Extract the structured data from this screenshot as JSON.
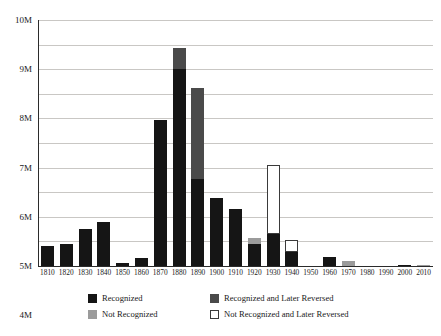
{
  "chart_data": {
    "type": "bar",
    "title": "",
    "subtitle": "",
    "xlabel": "",
    "ylabel": "",
    "stacked": true,
    "grid": true,
    "legend_position": "bottom",
    "ylim": [
      0,
      10000000
    ],
    "ytick_labels": [
      "0",
      "1M",
      "2M",
      "3M",
      "4M",
      "5M",
      "6M",
      "7M",
      "8M",
      "9M",
      "10M"
    ],
    "ytick_values": [
      0,
      1000000,
      2000000,
      3000000,
      4000000,
      5000000,
      6000000,
      7000000,
      8000000,
      9000000,
      10000000
    ],
    "categories": [
      "1810",
      "1820",
      "1830",
      "1840",
      "1850",
      "1860",
      "1870",
      "1880",
      "1890",
      "1900",
      "1910",
      "1920",
      "1930",
      "1940",
      "1950",
      "1960",
      "1970",
      "1980",
      "1990",
      "2000",
      "2010"
    ],
    "series": [
      {
        "name": "Recognized",
        "color": "#151515",
        "values": [
          800000,
          880000,
          1520000,
          1800000,
          130000,
          330000,
          5950000,
          8000000,
          3520000,
          2750000,
          2300000,
          900000,
          1320000,
          560000,
          0,
          350000,
          0,
          0,
          0,
          60000,
          0
        ]
      },
      {
        "name": "Recognized and Later Reversed",
        "color": "#4a4a4a",
        "values": [
          0,
          0,
          0,
          0,
          0,
          0,
          0,
          850000,
          3730000,
          0,
          0,
          0,
          0,
          0,
          0,
          0,
          0,
          0,
          0,
          0,
          0
        ]
      },
      {
        "name": "Not Recognized",
        "color": "#9b9b9b",
        "values": [
          0,
          0,
          0,
          0,
          0,
          0,
          0,
          0,
          0,
          0,
          0,
          250000,
          0,
          0,
          0,
          0,
          200000,
          0,
          0,
          0,
          50000
        ]
      },
      {
        "name": "Not Recognized and Later Reversed",
        "color": "#ffffff",
        "values": [
          0,
          0,
          0,
          0,
          0,
          0,
          0,
          0,
          0,
          0,
          0,
          0,
          2800000,
          500000,
          0,
          0,
          0,
          0,
          0,
          0,
          0
        ]
      }
    ],
    "totals": [
      800000,
      880000,
      1520000,
      1800000,
      130000,
      330000,
      5950000,
      8850000,
      7250000,
      2750000,
      2300000,
      1150000,
      4120000,
      1060000,
      0,
      350000,
      200000,
      0,
      0,
      60000,
      50000
    ]
  },
  "legend": {
    "items": [
      {
        "label": "Recognized",
        "swatch": "recognized"
      },
      {
        "label": "Recognized and Later Reversed",
        "swatch": "recognized-reversed"
      },
      {
        "label": "Not Recognized",
        "swatch": "not-recognized"
      },
      {
        "label": "Not Recognized and Later Reversed",
        "swatch": "not-recognized-reversed"
      }
    ]
  }
}
